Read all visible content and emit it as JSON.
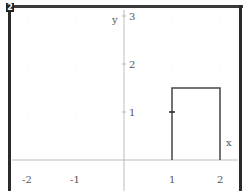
{
  "window": {
    "corner_badge": "2"
  },
  "chart_data": {
    "type": "line",
    "title": "",
    "xlabel": "x",
    "ylabel": "y",
    "xlim": [
      -2.4,
      2.4
    ],
    "ylim": [
      0,
      3.2
    ],
    "grid": "dots",
    "x_ticks": [
      -2,
      -1,
      1,
      2
    ],
    "x_tick_labels": [
      "-2",
      "-1",
      "1",
      "2"
    ],
    "y_ticks": [
      1,
      2,
      3
    ],
    "y_tick_labels": [
      "1",
      "2",
      "3"
    ],
    "series": [
      {
        "name": "step pulse",
        "points": [
          [
            1,
            0
          ],
          [
            1,
            1.5
          ],
          [
            2,
            1.5
          ],
          [
            2,
            0
          ]
        ],
        "color": "#444444"
      }
    ],
    "annotations": [
      {
        "type": "tick-mark",
        "x": 1,
        "y": 1
      }
    ]
  },
  "colors": {
    "frame": "#2a2a2a",
    "axis": "#bbbbbb",
    "curve": "#444444",
    "label": "#555555"
  }
}
